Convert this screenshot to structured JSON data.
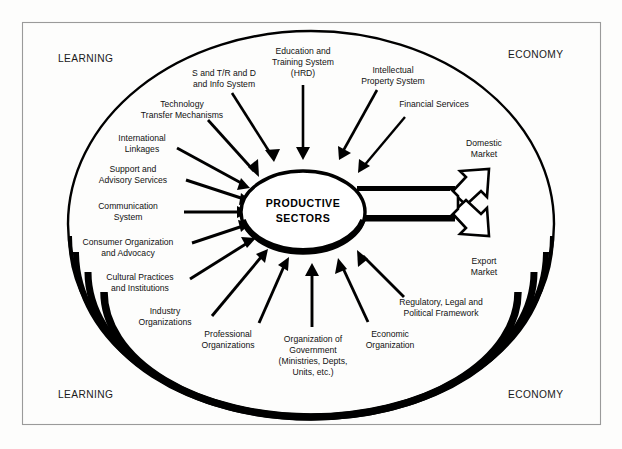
{
  "diagram": {
    "title_center_line1": "PRODUCTIVE",
    "title_center_line2": "SECTORS",
    "corners": {
      "top_left": "LEARNING",
      "top_right": "ECONOMY",
      "bottom_left": "LEARNING",
      "bottom_right": "ECONOMY"
    },
    "inputs": [
      {
        "id": "s-and-t",
        "lines": [
          "S and T/R and D",
          "and Info System"
        ]
      },
      {
        "id": "education-training",
        "lines": [
          "Education and",
          "Training System",
          "(HRD)"
        ]
      },
      {
        "id": "intellectual-property",
        "lines": [
          "Intellectual",
          "Property System"
        ]
      },
      {
        "id": "financial-services",
        "lines": [
          "Financial Services"
        ]
      },
      {
        "id": "technology-transfer",
        "lines": [
          "Technology",
          "Transfer Mechanisms"
        ]
      },
      {
        "id": "international-linkages",
        "lines": [
          "International",
          "Linkages"
        ]
      },
      {
        "id": "support-advisory",
        "lines": [
          "Support and",
          "Advisory Services"
        ]
      },
      {
        "id": "communication-system",
        "lines": [
          "Communication",
          "System"
        ]
      },
      {
        "id": "consumer-organization",
        "lines": [
          "Consumer Organization",
          "and Advocacy"
        ]
      },
      {
        "id": "cultural-practices",
        "lines": [
          "Cultural Practices",
          "and Institutions"
        ]
      },
      {
        "id": "industry-organizations",
        "lines": [
          "Industry",
          "Organizations"
        ]
      },
      {
        "id": "professional-organizations",
        "lines": [
          "Professional",
          "Organizations"
        ]
      },
      {
        "id": "organization-of-government",
        "lines": [
          "Organization of",
          "Government",
          "(Ministries, Depts,",
          "Units, etc.)"
        ]
      },
      {
        "id": "economic-organization",
        "lines": [
          "Economic",
          "Organization"
        ]
      },
      {
        "id": "regulatory-legal",
        "lines": [
          "Regulatory, Legal and",
          "Political Framework"
        ]
      }
    ],
    "outputs": [
      {
        "id": "domestic-market",
        "lines": [
          "Domestic",
          "Market"
        ]
      },
      {
        "id": "export-market",
        "lines": [
          "Export",
          "Market"
        ]
      }
    ],
    "colors": {
      "ink": "#000000",
      "frame": "#9a9a9a",
      "background": "#fdfdfc"
    }
  }
}
